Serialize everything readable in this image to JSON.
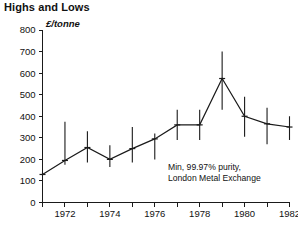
{
  "chart_data": {
    "type": "line",
    "title": "Highs and Lows",
    "subtitle": "",
    "xlabel": "",
    "ylabel": "£/tonne",
    "ylim": [
      0,
      800
    ],
    "xlim": [
      1971,
      1982
    ],
    "grid": false,
    "legend_position": "none",
    "y_ticks": [
      0,
      100,
      200,
      300,
      400,
      500,
      600,
      700,
      800
    ],
    "y_tick_labels": [
      "0",
      "100",
      "200",
      "300",
      "400",
      "500",
      "600",
      "700",
      "800"
    ],
    "x_ticks": [
      1971,
      1972,
      1973,
      1974,
      1975,
      1976,
      1977,
      1978,
      1979,
      1980,
      1981,
      1982
    ],
    "x_tick_labels": [
      "",
      "1972",
      "",
      "1974",
      "",
      "1976",
      "",
      "1978",
      "",
      "1980",
      "",
      "1982"
    ],
    "x_labeled_years": [
      "1972",
      "1974",
      "1976",
      "1978",
      "1980",
      "1982"
    ],
    "annotation_lines": [
      "Min, 99.97% purity,",
      "London Metal Exchange"
    ],
    "series": [
      {
        "name": "Annual price range (high-low)",
        "type": "range-bar",
        "x": [
          1971,
          1972,
          1973,
          1974,
          1975,
          1976,
          1977,
          1978,
          1979,
          1980,
          1981,
          1982
        ],
        "high": [
          140,
          140,
          375,
          330,
          265,
          350,
          320,
          430,
          430,
          700,
          490,
          440,
          400
        ],
        "low": [
          120,
          120,
          175,
          185,
          165,
          185,
          200,
          290,
          290,
          430,
          305,
          270,
          290
        ]
      },
      {
        "name": "Mid / average price",
        "type": "line",
        "x": [
          1971,
          1972,
          1973,
          1974,
          1975,
          1976,
          1977,
          1978,
          1979,
          1980,
          1981,
          1982
        ],
        "values": [
          130,
          195,
          255,
          200,
          250,
          295,
          360,
          360,
          575,
          400,
          365,
          350
        ]
      }
    ],
    "range_bars": [
      {
        "year": 1971,
        "high": 140,
        "low": 120,
        "mid": 130
      },
      {
        "year": 1972,
        "high": 375,
        "low": 175,
        "mid": 195
      },
      {
        "year": 1973,
        "high": 330,
        "low": 185,
        "mid": 255
      },
      {
        "year": 1974,
        "high": 265,
        "low": 165,
        "mid": 200
      },
      {
        "year": 1975,
        "high": 350,
        "low": 185,
        "mid": 250
      },
      {
        "year": 1976,
        "high": 320,
        "low": 200,
        "mid": 295
      },
      {
        "year": 1977,
        "high": 430,
        "low": 290,
        "mid": 360
      },
      {
        "year": 1978,
        "high": 430,
        "low": 290,
        "mid": 360
      },
      {
        "year": 1979,
        "high": 700,
        "low": 430,
        "mid": 575
      },
      {
        "year": 1980,
        "high": 490,
        "low": 305,
        "mid": 400
      },
      {
        "year": 1981,
        "high": 440,
        "low": 270,
        "mid": 365
      },
      {
        "year": 1982,
        "high": 400,
        "low": 290,
        "mid": 350
      }
    ],
    "colors": {
      "ink": "#1a1a1a",
      "background": "#ffffff"
    }
  }
}
